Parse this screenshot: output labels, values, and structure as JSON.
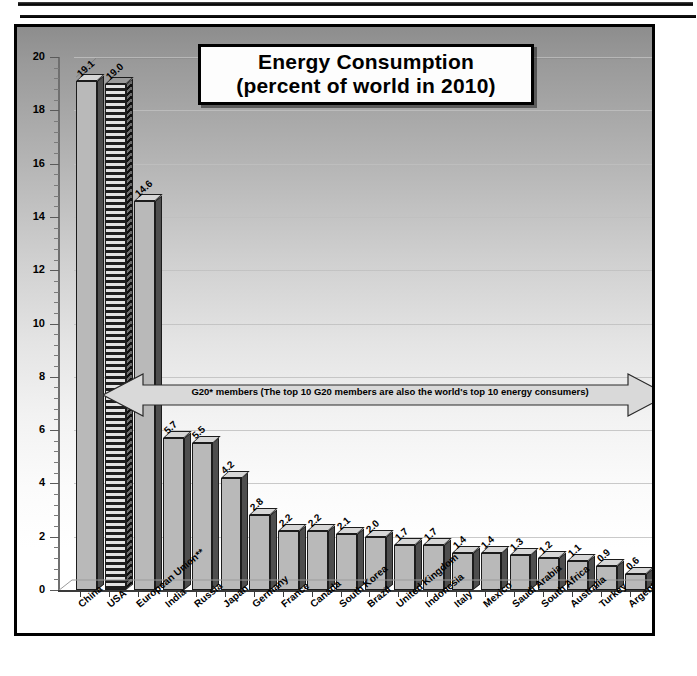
{
  "chart_data": {
    "type": "bar",
    "title": "Energy Consumption",
    "subtitle": "(percent of world in 2010)",
    "title_line1": "Energy Consumption",
    "title_line2": "(percent of world in 2010)",
    "xlabel": "",
    "ylabel": "percent of world",
    "ylim": [
      0,
      20
    ],
    "ytick_step": 2,
    "yticks": [
      0,
      2,
      4,
      6,
      8,
      10,
      12,
      14,
      16,
      18,
      20
    ],
    "ytick_labels": [
      "0",
      "2",
      "4",
      "6",
      "8",
      "10",
      "12",
      "14",
      "16",
      "18",
      "20"
    ],
    "grid": true,
    "legend": "none",
    "categories": [
      "China",
      "USA",
      "European Union**",
      "India",
      "Russia",
      "Japan",
      "Germany",
      "France",
      "Canada",
      "South Korea",
      "Brazil",
      "United Kingdom",
      "Indonesia",
      "Italy",
      "Mexico",
      "Saudi Arabia",
      "South Africa",
      "Australia",
      "Turkey",
      "Argentina"
    ],
    "values": [
      19.1,
      19.0,
      14.6,
      5.7,
      5.5,
      4.2,
      2.8,
      2.2,
      2.2,
      2.1,
      2.0,
      1.7,
      1.7,
      1.4,
      1.4,
      1.3,
      1.2,
      1.1,
      0.9,
      0.6
    ],
    "value_labels": [
      "19.1",
      "19.0",
      "14.6",
      "5.7",
      "5.5",
      "4.2",
      "2.8",
      "2.2",
      "2.2",
      "2.1",
      "2.0",
      "1.7",
      "1.7",
      "1.4",
      "1.4",
      "1.3",
      "1.2",
      "1.1",
      "0.9",
      "0.6"
    ],
    "bar_styles": [
      "solid",
      "hatched",
      "solid",
      "solid",
      "solid",
      "solid",
      "solid",
      "solid",
      "solid",
      "solid",
      "solid",
      "solid",
      "solid",
      "solid",
      "solid",
      "solid",
      "solid",
      "solid",
      "solid",
      "solid"
    ],
    "annotations": [
      {
        "name": "g20-span-arrow",
        "text": "G20* members (The top 10 G20 members are also the world's top 10 energy consumers)",
        "style": "double-headed-arrow",
        "y_value": 8,
        "spans_categories": [
          "China",
          "Argentina"
        ]
      }
    ],
    "colors": {
      "bar_front": "#b9b9b9",
      "bar_side": "#4e4e4e",
      "bar_top": "#d6d6d6",
      "outline": "#1c1c1c",
      "gridline": "#bfbfbf",
      "background_top": "#8d8d8d",
      "background_bottom": "#ffffff",
      "text": "#000000"
    }
  }
}
